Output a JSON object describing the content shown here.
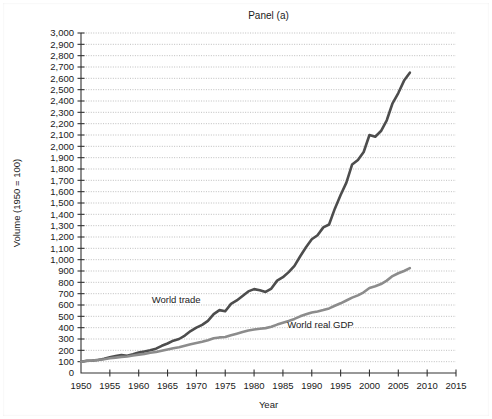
{
  "figure": {
    "title": "Panel (a)",
    "background": "#ffffff"
  },
  "chart_data": {
    "type": "line",
    "title": "Panel (a)",
    "xlabel": "Year",
    "ylabel": "Volume (1950 = 100)",
    "xlim": [
      1950,
      2015
    ],
    "ylim": [
      0,
      3000
    ],
    "grid": true,
    "xticks": [
      1950,
      1955,
      1960,
      1965,
      1970,
      1975,
      1980,
      1985,
      1990,
      1995,
      2000,
      2005,
      2010,
      2015
    ],
    "xtick_labels": [
      "1950",
      "1955",
      "1960",
      "1965",
      "1970",
      "1975",
      "1980",
      "1985",
      "1990",
      "1995",
      "2000",
      "2005",
      "2010",
      "2015"
    ],
    "yticks": [
      0,
      100,
      200,
      300,
      400,
      500,
      600,
      700,
      800,
      900,
      1000,
      1100,
      1200,
      1300,
      1400,
      1500,
      1600,
      1700,
      1800,
      1900,
      2000,
      2100,
      2200,
      2300,
      2400,
      2500,
      2600,
      2700,
      2800,
      2900,
      3000
    ],
    "ytick_labels": [
      "0",
      "100",
      "200",
      "300",
      "400",
      "500",
      "600",
      "700",
      "800",
      "900",
      "1,000",
      "1,100",
      "1,200",
      "1,300",
      "1,400",
      "1,500",
      "1,600",
      "1,700",
      "1,800",
      "1,900",
      "2,000",
      "2,100",
      "2,200",
      "2,300",
      "2,400",
      "2,500",
      "2,600",
      "2,700",
      "2,800",
      "2,900",
      "3,000"
    ],
    "legend": "inline-annotations",
    "series": [
      {
        "name": "World trade",
        "color": "#4d4d4d",
        "width": 2.6,
        "label_x": 1966.5,
        "label_y": 620,
        "x": [
          1950,
          1951,
          1952,
          1953,
          1954,
          1955,
          1956,
          1957,
          1958,
          1959,
          1960,
          1961,
          1962,
          1963,
          1964,
          1965,
          1966,
          1967,
          1968,
          1969,
          1970,
          1971,
          1972,
          1973,
          1974,
          1975,
          1976,
          1977,
          1978,
          1979,
          1980,
          1981,
          1982,
          1983,
          1984,
          1985,
          1986,
          1987,
          1988,
          1989,
          1990,
          1991,
          1992,
          1993,
          1994,
          1995,
          1996,
          1997,
          1998,
          1999,
          2000,
          2001,
          2002,
          2003,
          2004,
          2005,
          2006,
          2007
        ],
        "values": [
          100,
          108,
          110,
          115,
          125,
          138,
          150,
          158,
          152,
          165,
          180,
          190,
          200,
          215,
          240,
          260,
          285,
          300,
          330,
          370,
          400,
          425,
          460,
          520,
          555,
          545,
          610,
          640,
          680,
          720,
          740,
          730,
          715,
          745,
          815,
          845,
          890,
          945,
          1030,
          1110,
          1180,
          1215,
          1285,
          1310,
          1450,
          1570,
          1680,
          1840,
          1880,
          1950,
          2100,
          2085,
          2135,
          2230,
          2380,
          2470,
          2580,
          2650
        ]
      },
      {
        "name": "World real GDP",
        "color": "#8c8c8c",
        "width": 2.6,
        "label_x": 1991.5,
        "label_y": 398,
        "x": [
          1950,
          1951,
          1952,
          1953,
          1954,
          1955,
          1956,
          1957,
          1958,
          1959,
          1960,
          1961,
          1962,
          1963,
          1964,
          1965,
          1966,
          1967,
          1968,
          1969,
          1970,
          1971,
          1972,
          1973,
          1974,
          1975,
          1976,
          1977,
          1978,
          1979,
          1980,
          1981,
          1982,
          1983,
          1984,
          1985,
          1986,
          1987,
          1988,
          1989,
          1990,
          1991,
          1992,
          1993,
          1994,
          1995,
          1996,
          1997,
          1998,
          1999,
          2000,
          2001,
          2002,
          2003,
          2004,
          2005,
          2006,
          2007
        ],
        "values": [
          100,
          106,
          111,
          117,
          122,
          130,
          136,
          142,
          146,
          154,
          162,
          169,
          178,
          186,
          197,
          208,
          219,
          227,
          240,
          253,
          264,
          275,
          289,
          306,
          314,
          318,
          334,
          347,
          361,
          375,
          383,
          390,
          396,
          408,
          427,
          443,
          458,
          477,
          500,
          518,
          534,
          543,
          555,
          570,
          593,
          615,
          640,
          665,
          685,
          712,
          750,
          765,
          785,
          815,
          855,
          880,
          900,
          925
        ]
      }
    ]
  },
  "axis_style": {
    "grid_color": "#b8b8b8",
    "axis_color": "#333333",
    "text_color": "#1a1a1a"
  }
}
